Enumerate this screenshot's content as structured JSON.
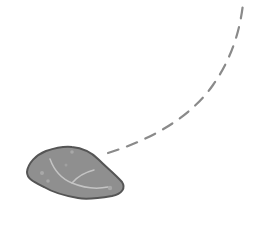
{
  "scene": {
    "background": "#ffffff",
    "trajectory": {
      "label": "dashed-trajectory",
      "color": "#8a8a8a",
      "dash": "11 9"
    },
    "rock": {
      "label": "rock",
      "fill": "#8f8f8f",
      "outline": "#555555",
      "highlight": "#c4c4c4"
    }
  }
}
